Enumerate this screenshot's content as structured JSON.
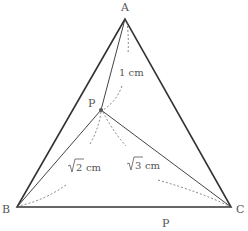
{
  "figure": {
    "vertices": {
      "A": "A",
      "B": "B",
      "C": "C"
    },
    "point": "P",
    "bottom_label": "P",
    "measurements": {
      "PA": "1 cm",
      "PB_radicand": "2",
      "PB_unit": "cm",
      "PC_radicand": "3",
      "PC_unit": "cm"
    }
  }
}
